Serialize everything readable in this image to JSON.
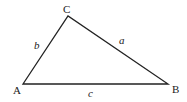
{
  "diagram": {
    "type": "triangle",
    "stroke_color": "#222222",
    "vertices": {
      "A": {
        "label": "A",
        "x": 23,
        "y": 84
      },
      "B": {
        "label": "B",
        "x": 168,
        "y": 84
      },
      "C": {
        "label": "C",
        "x": 68,
        "y": 16
      }
    },
    "sides": {
      "a": {
        "label": "a",
        "from": "C",
        "to": "B"
      },
      "b": {
        "label": "b",
        "from": "A",
        "to": "C"
      },
      "c": {
        "label": "c",
        "from": "A",
        "to": "B"
      }
    }
  }
}
